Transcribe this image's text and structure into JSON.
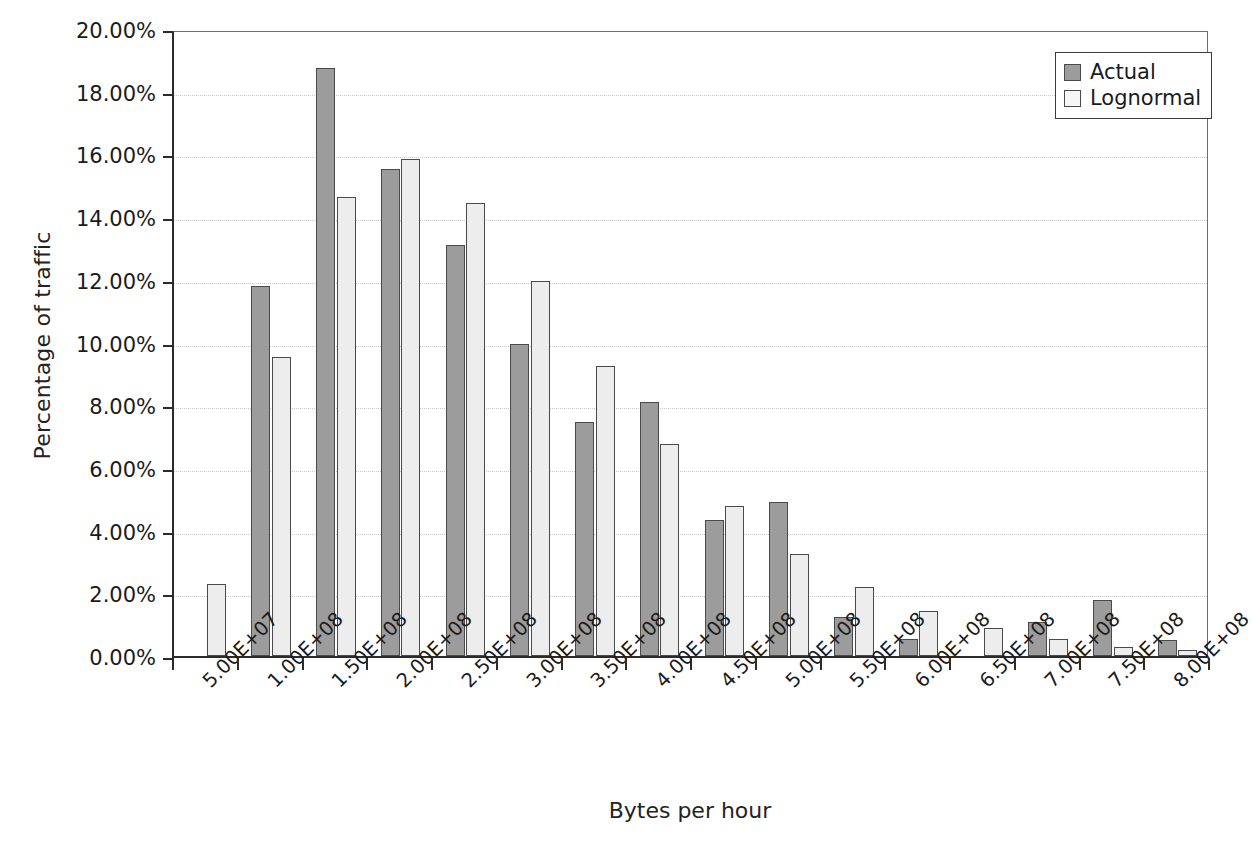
{
  "chart_data": {
    "type": "bar",
    "title": "",
    "xlabel": "Bytes per hour",
    "ylabel": "Percentage of traffic",
    "ylim": [
      0,
      20
    ],
    "ytick_labels": [
      "0.00%",
      "2.00%",
      "4.00%",
      "6.00%",
      "8.00%",
      "10.00%",
      "12.00%",
      "14.00%",
      "16.00%",
      "18.00%",
      "20.00%"
    ],
    "ytick_values": [
      0,
      2,
      4,
      6,
      8,
      10,
      12,
      14,
      16,
      18,
      20
    ],
    "grid": true,
    "legend_position": "top-right",
    "categories": [
      "5.00E+07",
      "1.00E+08",
      "1.50E+08",
      "2.00E+08",
      "2.50E+08",
      "3.00E+08",
      "3.50E+08",
      "4.00E+08",
      "4.50E+08",
      "5.00E+08",
      "5.50E+08",
      "6.00E+08",
      "6.50E+08",
      "7.00E+08",
      "7.50E+08",
      "8.00E+08"
    ],
    "series": [
      {
        "name": "Actual",
        "color": "#9c9c9c",
        "values": [
          0,
          11.8,
          18.75,
          15.55,
          13.1,
          9.95,
          7.45,
          8.1,
          4.35,
          4.9,
          1.25,
          0.55,
          0,
          1.1,
          1.8,
          0.5
        ]
      },
      {
        "name": "Lognormal",
        "color": "#ededed",
        "values": [
          2.3,
          9.55,
          14.65,
          15.85,
          14.45,
          11.95,
          9.25,
          6.75,
          4.8,
          3.25,
          2.2,
          1.45,
          0.9,
          0.55,
          0.3,
          0.2
        ]
      }
    ]
  },
  "legend": {
    "entries": [
      {
        "label": "Actual",
        "key": "actual"
      },
      {
        "label": "Lognormal",
        "key": "lognormal"
      }
    ]
  }
}
